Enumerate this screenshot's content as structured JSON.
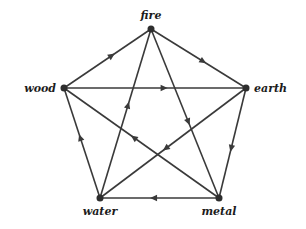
{
  "title": "",
  "nodes": [
    {
      "id": "fire",
      "label": "fire"
    },
    {
      "id": "wood",
      "label": "wood"
    },
    {
      "id": "earth",
      "label": "earth"
    },
    {
      "id": "water",
      "label": "water"
    },
    {
      "id": "metal",
      "label": "metal"
    }
  ],
  "edges": [
    {
      "from": "wood",
      "to": "fire",
      "cycle": "outer"
    },
    {
      "from": "fire",
      "to": "earth",
      "cycle": "outer"
    },
    {
      "from": "earth",
      "to": "metal",
      "cycle": "outer"
    },
    {
      "from": "metal",
      "to": "water",
      "cycle": "outer"
    },
    {
      "from": "water",
      "to": "wood",
      "cycle": "outer"
    },
    {
      "from": "wood",
      "to": "earth",
      "cycle": "inner"
    },
    {
      "from": "earth",
      "to": "water",
      "cycle": "inner"
    },
    {
      "from": "water",
      "to": "fire",
      "cycle": "inner"
    },
    {
      "from": "fire",
      "to": "metal",
      "cycle": "inner"
    },
    {
      "from": "metal",
      "to": "wood",
      "cycle": "inner"
    }
  ],
  "colors": {
    "line": "#3a3a3a",
    "text": "#1c1c1c",
    "background": "#ffffff"
  }
}
